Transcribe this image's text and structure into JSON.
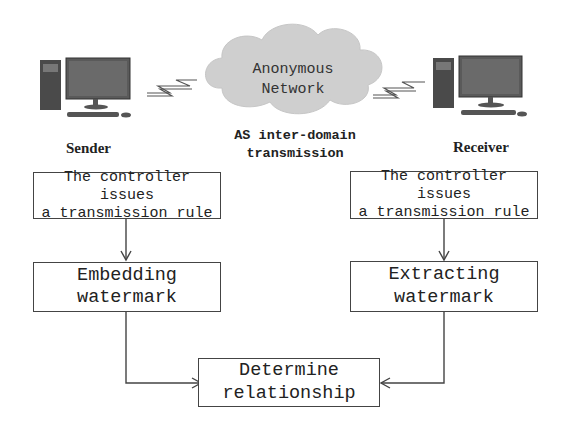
{
  "network": {
    "title_line1": "Anonymous",
    "title_line2": "Network",
    "caption_line1": "AS inter-domain",
    "caption_line2": "transmission",
    "icon": "cloud-icon"
  },
  "sender": {
    "label": "Sender",
    "icon": "desktop-computer-icon",
    "link_icon": "wireless-link-icon",
    "step1_line1": "The controller issues",
    "step1_line2": "a transmission rule",
    "step2_line1": "Embedding",
    "step2_line2": "watermark"
  },
  "receiver": {
    "label": "Receiver",
    "icon": "desktop-computer-icon",
    "link_icon": "wireless-link-icon",
    "step1_line1": "The controller issues",
    "step1_line2": "a transmission rule",
    "step2_line1": "Extracting",
    "step2_line2": "watermark"
  },
  "result": {
    "line1": "Determine",
    "line2": "relationship"
  },
  "colors": {
    "line": "#444444",
    "cloud": "#cfcfcf",
    "monitor": "#5a5a5a"
  }
}
